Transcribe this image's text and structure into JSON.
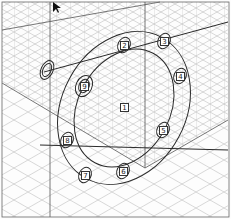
{
  "diagram": {
    "type": "isometric bolt tightening sequence",
    "colors": {
      "grid": "#b8b8b8",
      "outline": "#2a2a2a",
      "background": "#fdfdfd"
    },
    "center_label": "1",
    "bolts": [
      {
        "label": "2",
        "x": 124,
        "y": 45
      },
      {
        "label": "3",
        "x": 164,
        "y": 41
      },
      {
        "label": "4",
        "x": 180,
        "y": 76
      },
      {
        "label": "5",
        "x": 163,
        "y": 130
      },
      {
        "label": "6",
        "x": 123,
        "y": 171
      },
      {
        "label": "7",
        "x": 85,
        "y": 175
      },
      {
        "label": "8",
        "x": 67,
        "y": 140
      },
      {
        "label": "9",
        "x": 84,
        "y": 86
      }
    ],
    "center": {
      "label": "1",
      "x": 124,
      "y": 107
    }
  }
}
